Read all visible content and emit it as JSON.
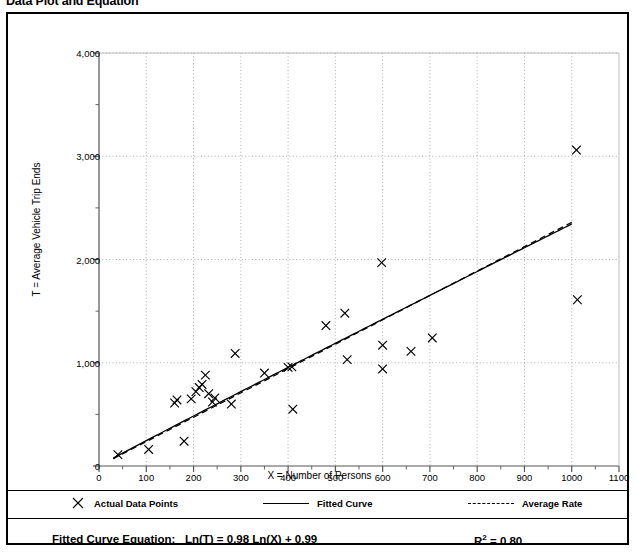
{
  "page_title": "Data Plot and Equation",
  "chart_data": {
    "type": "scatter",
    "title": "Data Plot and Equation",
    "xlabel": "X = Number of Persons",
    "ylabel": "T = Average Vehicle Trip Ends",
    "xlim": [
      0,
      1100
    ],
    "ylim": [
      0,
      4000
    ],
    "xticks": [
      0,
      100,
      200,
      300,
      400,
      500,
      600,
      700,
      800,
      900,
      1000,
      1100
    ],
    "xtick_labels": [
      "0",
      "100",
      "200",
      "300",
      "400",
      "500",
      "600",
      "700",
      "800",
      "900",
      "1000",
      "1100"
    ],
    "yticks": [
      0,
      1000,
      2000,
      3000,
      4000
    ],
    "ytick_labels": [
      "0",
      "1,000",
      "2,000",
      "3,000",
      "4,000"
    ],
    "x_minor_step": 50,
    "y_minor_step": 500,
    "grid": true,
    "grid_style": "dotted",
    "legend_position": "below-plot",
    "series": [
      {
        "name": "Actual Data Points",
        "type": "scatter",
        "marker": "x",
        "color": "#000000",
        "points": [
          [
            40,
            110
          ],
          [
            105,
            160
          ],
          [
            160,
            610
          ],
          [
            165,
            640
          ],
          [
            180,
            240
          ],
          [
            195,
            650
          ],
          [
            205,
            720
          ],
          [
            212,
            760
          ],
          [
            218,
            790
          ],
          [
            225,
            880
          ],
          [
            232,
            700
          ],
          [
            240,
            620
          ],
          [
            245,
            660
          ],
          [
            280,
            600
          ],
          [
            288,
            1090
          ],
          [
            350,
            900
          ],
          [
            400,
            955
          ],
          [
            408,
            960
          ],
          [
            410,
            550
          ],
          [
            480,
            1360
          ],
          [
            520,
            1480
          ],
          [
            525,
            1030
          ],
          [
            598,
            1970
          ],
          [
            600,
            1170
          ],
          [
            600,
            940
          ],
          [
            660,
            1110
          ],
          [
            705,
            1240
          ],
          [
            1010,
            3060
          ],
          [
            1012,
            1610
          ]
        ]
      },
      {
        "name": "Fitted Curve",
        "type": "line",
        "style": "solid",
        "color": "#000000",
        "equation": "Ln(T) = 0.98 Ln(X) + 0.99",
        "coef_slope": 0.98,
        "coef_intercept": 0.99,
        "x_range": [
          30,
          1000
        ]
      },
      {
        "name": "Average Rate",
        "type": "line",
        "style": "dashed",
        "color": "#000000",
        "x_range": [
          30,
          1000
        ],
        "rate_per_person": 2.36
      }
    ],
    "annotations": {
      "equation_label": "Fitted Curve Equation:",
      "equation_text": "Ln(T) = 0.98 Ln(X) + 0.99",
      "r_squared_label": "R",
      "r_squared_sup": "2",
      "r_squared_value": "= 0.80"
    }
  },
  "legend": {
    "items": [
      {
        "label": "Actual Data Points",
        "marker": "cross-marker-icon"
      },
      {
        "label": "Fitted Curve",
        "marker": "solid-line-icon"
      },
      {
        "label": "Average Rate",
        "marker": "dashed-line-icon"
      }
    ]
  }
}
